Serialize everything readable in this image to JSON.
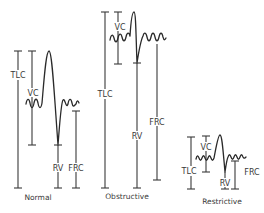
{
  "diagram": {
    "panels": [
      {
        "id": "normal",
        "caption": "Normal",
        "labels": {
          "tlc": "TLC",
          "vc": "VC",
          "rv": "RV",
          "frc": "FRC"
        }
      },
      {
        "id": "obstructive",
        "caption": "Obstructive",
        "labels": {
          "tlc": "TLC",
          "vc": "VC",
          "rv": "RV",
          "frc": "FRC"
        }
      },
      {
        "id": "restrictive",
        "caption": "Restrictive",
        "labels": {
          "tlc": "TLC",
          "vc": "VC",
          "rv": "RV",
          "frc": "FRC"
        }
      }
    ],
    "colors": {
      "line": "#3a3a3a",
      "background": "#ffffff"
    }
  }
}
